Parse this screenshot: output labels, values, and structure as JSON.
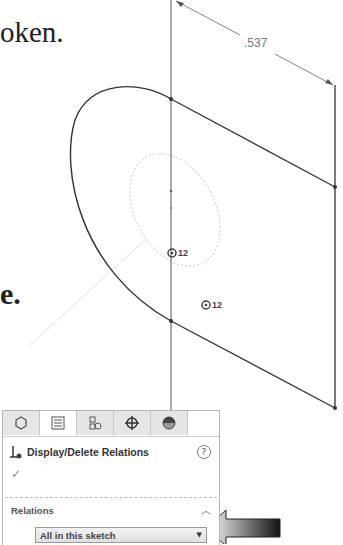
{
  "book_text": {
    "top_fragment": "oken.",
    "middle_fragment": "e."
  },
  "sketch": {
    "dimension_value": ".537",
    "relation_markers": [
      {
        "icon": "concentric-icon",
        "label": "12"
      },
      {
        "icon": "concentric-icon",
        "label": "12"
      }
    ]
  },
  "property_manager": {
    "tabs": [
      {
        "name": "feature-manager",
        "icon": "part-icon"
      },
      {
        "name": "property-manager",
        "icon": "list-icon"
      },
      {
        "name": "configuration-manager",
        "icon": "config-icon"
      },
      {
        "name": "dimxpert-manager",
        "icon": "crosshair-icon"
      },
      {
        "name": "display-manager",
        "icon": "appearance-icon"
      }
    ],
    "title": "Display/Delete Relations",
    "help_label": "?",
    "ok_icon": "✓",
    "relations_group": {
      "label": "Relations",
      "filter_value": "All in this sketch"
    }
  }
}
